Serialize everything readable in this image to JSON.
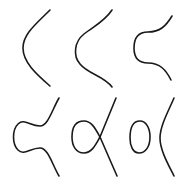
{
  "diagram": {
    "stroke_color": "#1a1a1a",
    "background": "#ffffff",
    "stroke_width": 1.6,
    "curves": [
      {
        "id": "curve-1",
        "row": 1,
        "col": 1,
        "shape": "single-branch-smooth",
        "d": "M50 10 C 36 24, 23 34, 23 48 C 23 62, 36 74, 50 86"
      },
      {
        "id": "curve-2",
        "row": 1,
        "col": 2,
        "shape": "single-branch-flattened",
        "d": "M112 10 C 104 22, 94 26, 84 34 C 74 42, 73 56, 80 64 C 88 74, 104 76, 112 87"
      },
      {
        "id": "curve-3",
        "row": 1,
        "col": 3,
        "shape": "single-branch-wavy",
        "d": "M172 16 C 166 26, 160 32, 148 32 C 138 32, 134 38, 134 48 C 134 58, 138 63, 148 63 C 160 63, 166 70, 171 80"
      },
      {
        "id": "curve-4",
        "row": 2,
        "col": 1,
        "shape": "single-branch-pinched",
        "d": "M59 98 C 52 110, 48 126, 40 126 C 30 126, 24 118, 18 124 C 12 130, 12 144, 18 150 C 24 156, 30 148, 40 148 C 48 148, 52 164, 59 176"
      },
      {
        "id": "curve-5",
        "row": 2,
        "col": 2,
        "shape": "oval-plus-branch-nodal",
        "oval": "M84 121 C 74 121, 72 130, 72 137 C 72 146, 76 153, 84 153 C 92 153, 96 144, 100 137 C 96 130, 92 121, 84 121 Z",
        "branch": "M116 98 L 100 137 L 117 176"
      },
      {
        "id": "curve-6",
        "row": 2,
        "col": 3,
        "shape": "oval-plus-branch-separated",
        "oval": "M140 121 C 132 121, 130 130, 130 138 C 130 146, 133 153, 139 153 C 146 153, 150 146, 150 137 C 150 128, 146 121, 140 121 Z",
        "branch": "M174 98 C 168 112, 160 126, 160 138 C 160 150, 168 164, 174 176"
      }
    ]
  }
}
